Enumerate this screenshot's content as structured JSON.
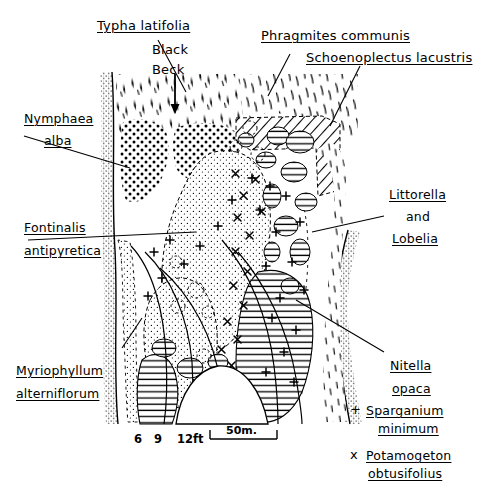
{
  "figure": {
    "type": "vegetation-map",
    "inflow_label_1": "Black",
    "inflow_label_2": "Beck"
  },
  "labels": {
    "typha": "Typha latifolia",
    "phragmites": "Phragmites communis",
    "schoenoplectus": "Schoenoplectus lacustris",
    "nymphaea_1": "Nymphaea",
    "nymphaea_2": "alba",
    "fontinalis_1": "Fontinalis",
    "fontinalis_2": "antipyretica",
    "littorella_1": "Littorella",
    "littorella_2": "and",
    "littorella_3": "Lobelia",
    "myriophyllum_1": "Myriophyllum",
    "myriophyllum_2": "alterniflorum",
    "nitella_1": "Nitella",
    "nitella_2": "opaca"
  },
  "legend": {
    "items": [
      {
        "symbol": "+",
        "name_1": "Sparganium",
        "name_2": "minimum"
      },
      {
        "symbol": "x",
        "name_1": "Potamogeton",
        "name_2": "obtusifolius"
      }
    ]
  },
  "depth_contours": {
    "unit": "ft",
    "values": [
      "6",
      "9",
      "12ft"
    ]
  },
  "scale_bar": {
    "text": "50m."
  },
  "colors": {
    "ink": "#000000",
    "shore": "#9a9a9a",
    "paper": "#ffffff"
  }
}
